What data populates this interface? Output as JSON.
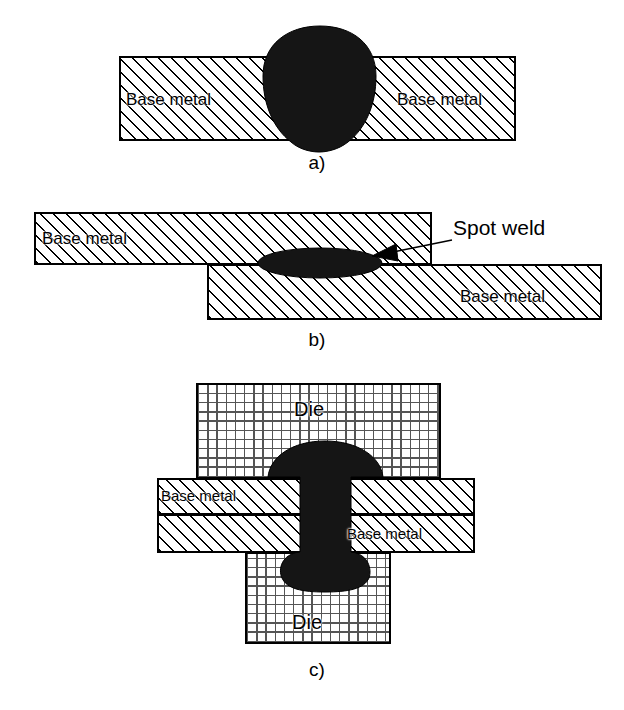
{
  "figure": {
    "background_color": "#ffffff",
    "weld_color": "#151515",
    "line_color": "#000000"
  },
  "panels": [
    {
      "id": "a",
      "caption": "a)",
      "description": "Fusion weld bead through a single base metal plate",
      "labels": [
        {
          "name": "base-metal-left",
          "text": "Base metal"
        },
        {
          "name": "base-metal-right",
          "text": "Base metal"
        }
      ]
    },
    {
      "id": "b",
      "caption": "b)",
      "description": "Lap joint spot weld between two overlapping base metal sheets",
      "labels": [
        {
          "name": "base-metal-upper",
          "text": "Base metal"
        },
        {
          "name": "base-metal-lower",
          "text": "Base metal"
        }
      ],
      "callout": {
        "name": "spot-weld-callout",
        "text": "Spot weld"
      }
    },
    {
      "id": "c",
      "caption": "c)",
      "description": "Riveted / upset joint between dies clamping two base metal sheets",
      "labels": [
        {
          "name": "die-upper",
          "text": "Die"
        },
        {
          "name": "base-metal-upper",
          "text": "Base metal"
        },
        {
          "name": "base-metal-lower",
          "text": "Base metal"
        },
        {
          "name": "die-lower",
          "text": "Die"
        }
      ]
    }
  ]
}
